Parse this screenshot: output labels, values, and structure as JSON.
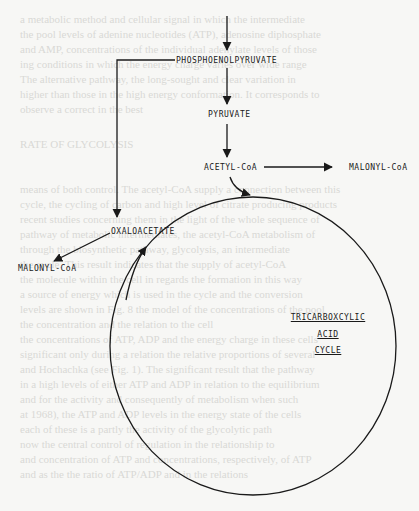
{
  "diagram": {
    "nodes": {
      "phosphoenolpyruvate": "PHOSPHOENOLPYRUVATE",
      "pyruvate": "PYRUVATE",
      "acetyl_coa": "ACETYL-CoA",
      "malonyl_coa_right": "MALONYL-CoA",
      "oxaloacetate": "OXALOACETATE",
      "malonyl_coa_left": "MALONYL-CoA",
      "cycle_line1": "TRICARBOXCYLIC",
      "cycle_line2": "ACID",
      "cycle_line3": "CYCLE"
    },
    "edges": [
      {
        "from": "(above)",
        "to": "PHOSPHOENOLPYRUVATE"
      },
      {
        "from": "PHOSPHOENOLPYRUVATE",
        "to": "PYRUVATE"
      },
      {
        "from": "PYRUVATE",
        "to": "ACETYL-CoA"
      },
      {
        "from": "ACETYL-CoA",
        "to": "MALONYL-CoA"
      },
      {
        "from": "ACETYL-CoA",
        "to": "TRICARBOXCYLIC ACID CYCLE"
      },
      {
        "from": "PHOSPHOENOLPYRUVATE",
        "to": "OXALOACETATE"
      },
      {
        "from": "OXALOACETATE",
        "to": "MALONYL-CoA"
      },
      {
        "from": "TRICARBOXCYLIC ACID CYCLE",
        "to": "OXALOACETATE"
      }
    ],
    "colors": {
      "ink": "#1a1a1a",
      "paper": "#f7f7f5"
    }
  }
}
